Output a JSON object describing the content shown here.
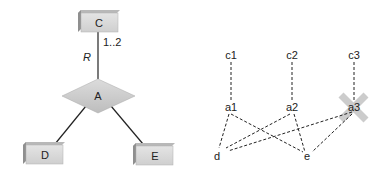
{
  "left_diagram": {
    "entities": [
      {
        "id": "C",
        "label": "C"
      },
      {
        "id": "D",
        "label": "D"
      },
      {
        "id": "E",
        "label": "E"
      }
    ],
    "relationship": {
      "label": "A"
    },
    "role_label": "R",
    "multiplicity": "1..2"
  },
  "right_diagram": {
    "nodes": {
      "c1": "c1",
      "c2": "c2",
      "c3": "c3",
      "a1": "a1",
      "a2": "a2",
      "a3": "a3",
      "d": "d",
      "e": "e"
    },
    "edges": [
      [
        "c1",
        "a1"
      ],
      [
        "c2",
        "a2"
      ],
      [
        "c3",
        "a3"
      ],
      [
        "a1",
        "d"
      ],
      [
        "a1",
        "e"
      ],
      [
        "a2",
        "d"
      ],
      [
        "a2",
        "e"
      ],
      [
        "a3",
        "d"
      ],
      [
        "a3",
        "e"
      ]
    ],
    "crossed_out": "a3",
    "cross_color": "#c8c8c8"
  },
  "colors": {
    "box_fill": "#d4d4d4",
    "box_shadow": "#9a9a9a",
    "line": "#222222"
  }
}
